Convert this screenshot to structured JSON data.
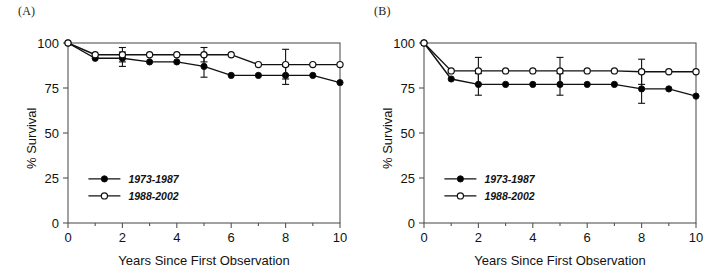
{
  "figure": {
    "panels": [
      {
        "id": "A",
        "label": "(A)",
        "chart_data": {
          "type": "line",
          "title": "(A)",
          "xlabel": "Years Since First Observation",
          "ylabel": "% Survival",
          "xlim": [
            0,
            10
          ],
          "ylim": [
            0,
            100
          ],
          "xticks": [
            0,
            2,
            4,
            6,
            8,
            10
          ],
          "xticklabels": [
            "0",
            "2",
            "4",
            "6",
            "8",
            "10"
          ],
          "yticks": [
            0,
            25,
            50,
            75,
            100
          ],
          "yticklabels": [
            "0",
            "25",
            "50",
            "75",
            "100"
          ],
          "grid": false,
          "legend_position": "lower-left-inside",
          "x": [
            0,
            1,
            2,
            3,
            4,
            5,
            6,
            7,
            8,
            9,
            10
          ],
          "series": [
            {
              "name": "1973-1987",
              "marker": "filled-circle",
              "values": [
                100,
                91.5,
                91.5,
                89.5,
                89.5,
                87,
                82,
                82,
                82,
                82,
                78
              ],
              "errors": [
                {
                  "x": 2,
                  "y": 91.5,
                  "low": 87,
                  "high": 95
                },
                {
                  "x": 5,
                  "y": 87,
                  "low": 81,
                  "high": 93
                },
                {
                  "x": 8,
                  "y": 82,
                  "low": 77,
                  "high": 87
                }
              ]
            },
            {
              "name": "1988-2002",
              "marker": "open-circle",
              "values": [
                100,
                93.5,
                93.5,
                93.5,
                93.5,
                93.5,
                93.5,
                88,
                88,
                88,
                88
              ],
              "errors": [
                {
                  "x": 2,
                  "y": 93.5,
                  "low": 89.5,
                  "high": 97.5
                },
                {
                  "x": 5,
                  "y": 93.5,
                  "low": 89.5,
                  "high": 97.5
                },
                {
                  "x": 8,
                  "y": 88,
                  "low": 80,
                  "high": 96.5
                }
              ]
            }
          ]
        }
      },
      {
        "id": "B",
        "label": "(B)",
        "chart_data": {
          "type": "line",
          "title": "(B)",
          "xlabel": "Years Since First Observation",
          "ylabel": "% Survival",
          "xlim": [
            0,
            10
          ],
          "ylim": [
            0,
            100
          ],
          "xticks": [
            0,
            2,
            4,
            6,
            8,
            10
          ],
          "xticklabels": [
            "0",
            "2",
            "4",
            "6",
            "8",
            "10"
          ],
          "yticks": [
            0,
            25,
            50,
            75,
            100
          ],
          "yticklabels": [
            "0",
            "25",
            "50",
            "75",
            "100"
          ],
          "grid": false,
          "legend_position": "lower-left-inside",
          "x": [
            0,
            1,
            2,
            3,
            4,
            5,
            6,
            7,
            8,
            9,
            10
          ],
          "series": [
            {
              "name": "1973-1987",
              "marker": "filled-circle",
              "values": [
                100,
                80,
                77,
                77,
                77,
                77,
                77,
                77,
                74.5,
                74.5,
                70.5
              ],
              "errors": [
                {
                  "x": 2,
                  "y": 77,
                  "low": 71,
                  "high": 83
                },
                {
                  "x": 5,
                  "y": 77,
                  "low": 71,
                  "high": 83
                },
                {
                  "x": 8,
                  "y": 74.5,
                  "low": 66.5,
                  "high": 83
                }
              ]
            },
            {
              "name": "1988-2002",
              "marker": "open-circle",
              "values": [
                100,
                84.5,
                84.5,
                84.5,
                84.5,
                84.5,
                84.5,
                84.5,
                84,
                84,
                84
              ],
              "errors": [
                {
                  "x": 2,
                  "y": 84.5,
                  "low": 77,
                  "high": 92
                },
                {
                  "x": 5,
                  "y": 84.5,
                  "low": 77,
                  "high": 92
                },
                {
                  "x": 8,
                  "y": 84,
                  "low": 77,
                  "high": 91
                }
              ]
            }
          ]
        }
      }
    ]
  },
  "colors": {
    "axis": "#555555",
    "line": "#111111",
    "marker_filled": "#000000",
    "marker_open_fill": "#ffffff",
    "text": "#121212"
  }
}
